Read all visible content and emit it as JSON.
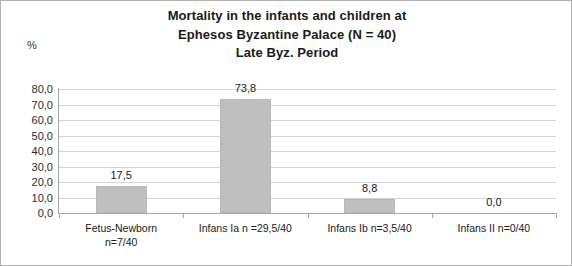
{
  "chart_data": {
    "type": "bar",
    "title": "Mortality in the infants and children at Ephesos Byzantine Palace (N = 40) Late Byz. Period",
    "title_lines": [
      "Mortality in the infants and children at",
      "Ephesos Byzantine Palace (N = 40)",
      "Late Byz. Period"
    ],
    "categories": [
      "Fetus-Newborn n=7/40",
      "Infans Ia n =29,5/40",
      "Infans Ib n=3,5/40",
      "Infans II n=0/40"
    ],
    "category_lines": [
      [
        "Fetus-Newborn",
        "n=7/40"
      ],
      [
        "Infans Ia n =29,5/40"
      ],
      [
        "Infans Ib n=3,5/40"
      ],
      [
        "Infans II n=0/40"
      ]
    ],
    "values": [
      17.5,
      73.8,
      8.8,
      0.0
    ],
    "data_labels": [
      "17,5",
      "73,8",
      "8,8",
      "0,0"
    ],
    "xlabel": "",
    "ylabel": "%",
    "ylim": [
      0,
      80
    ],
    "ytick_step": 10,
    "ytick_labels": [
      "80,0",
      "70,0",
      "60,0",
      "50,0",
      "40,0",
      "30,0",
      "20,0",
      "10,0",
      "0,0"
    ],
    "ytick_values": [
      80,
      70,
      60,
      50,
      40,
      30,
      20,
      10,
      0
    ],
    "grid": true,
    "legend": false,
    "bar_color": "#bfbfbf",
    "gridline_color": "#d4d4d4",
    "axis_color": "#a8a8a8",
    "text_color": "#1a1a1a"
  }
}
